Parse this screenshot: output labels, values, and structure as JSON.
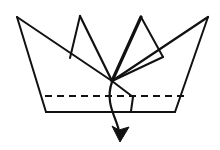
{
  "figure": {
    "kind": "origami-diagram",
    "canvas": {
      "width": 220,
      "height": 150,
      "background": "#ffffff"
    },
    "colors": {
      "line": "#111111",
      "paper": "#ffffff",
      "arrow": "#111111"
    },
    "stroke_widths": {
      "thin": 1.6,
      "medium": 2.0,
      "thick": 3.2,
      "dash": 1.8,
      "arrow": 2.2
    },
    "dash_pattern": "7 5"
  },
  "geometry": {
    "center_vertex": {
      "name": "convergence-point",
      "x": 112,
      "y": 81
    },
    "peaks": [
      {
        "name": "peak-far-left",
        "x": 17,
        "y": 17
      },
      {
        "name": "peak-inner-left",
        "x": 80,
        "y": 16
      },
      {
        "name": "peak-inner-right",
        "x": 141,
        "y": 17
      },
      {
        "name": "peak-far-right",
        "x": 208,
        "y": 17
      }
    ],
    "base_corners": [
      {
        "name": "base-left",
        "x": 46,
        "y": 112
      },
      {
        "name": "base-right",
        "x": 175,
        "y": 112
      }
    ],
    "fold_line": {
      "y": 96,
      "x_start": 45,
      "x_end": 185
    },
    "bottom_edge": {
      "y": 112,
      "x_start": 46,
      "x_end": 175
    },
    "flap": {
      "apex": {
        "x": 112,
        "y": 81
      },
      "elbow": {
        "x": 133,
        "y": 97
      },
      "foot": {
        "x": 131,
        "y": 111
      }
    },
    "arrow": {
      "start": {
        "x": 112,
        "y": 82
      },
      "control_1": {
        "x": 104,
        "y": 104
      },
      "control_2": {
        "x": 118,
        "y": 120
      },
      "tip": {
        "x": 120,
        "y": 141
      }
    }
  },
  "labels": {
    "caption": "",
    "step_number": ""
  }
}
